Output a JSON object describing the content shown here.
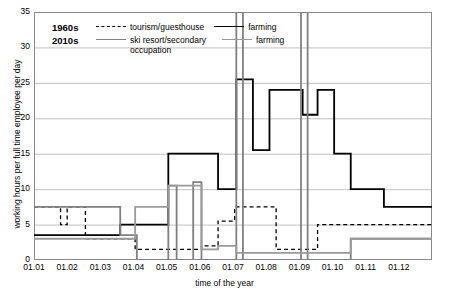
{
  "chart_data": {
    "type": "line",
    "title": "",
    "xlabel": "time of the year",
    "ylabel": "working hours per full time employee per day",
    "ylim": [
      0,
      35
    ],
    "yticks": [
      0,
      5,
      10,
      15,
      20,
      25,
      30,
      35
    ],
    "xticks": [
      "01.01",
      "01.02",
      "01.03",
      "01.04",
      "01.05",
      "01.06",
      "01.07",
      "01.08",
      "01.09",
      "01.10",
      "01.11",
      "01.12"
    ],
    "grid": true,
    "legend": {
      "position": "top-left-inside",
      "groups": [
        {
          "label": "1960s",
          "items": [
            {
              "name": "tourism/guesthouse",
              "style": "dashed",
              "color": "#000000"
            },
            {
              "name": "farming",
              "style": "solid",
              "color": "#000000"
            }
          ]
        },
        {
          "label": "2010s",
          "items": [
            {
              "name": "ski resort/secondary occupation",
              "style": "solid",
              "color": "#808080"
            },
            {
              "name": "farming",
              "style": "solid",
              "color": "#9a9a9a"
            }
          ]
        }
      ]
    },
    "series": [
      {
        "name": "1960s tourism/guesthouse",
        "color": "#000000",
        "dash": "4,3",
        "width": 1.3,
        "steps": [
          {
            "x": 0.0,
            "y": 7.5
          },
          {
            "x": 0.8,
            "y": 7.5
          },
          {
            "x": 0.8,
            "y": 5.0
          },
          {
            "x": 1.0,
            "y": 5.0
          },
          {
            "x": 1.0,
            "y": 7.5
          },
          {
            "x": 1.55,
            "y": 7.5
          },
          {
            "x": 1.55,
            "y": 3.0
          },
          {
            "x": 3.05,
            "y": 3.0
          },
          {
            "x": 3.05,
            "y": 1.5
          },
          {
            "x": 5.05,
            "y": 1.5
          },
          {
            "x": 5.05,
            "y": 2.0
          },
          {
            "x": 5.55,
            "y": 2.0
          },
          {
            "x": 5.55,
            "y": 5.5
          },
          {
            "x": 6.05,
            "y": 5.5
          },
          {
            "x": 6.05,
            "y": 7.5
          },
          {
            "x": 6.55,
            "y": 7.5
          },
          {
            "x": 6.55,
            "y": 7.5
          },
          {
            "x": 7.3,
            "y": 7.5
          },
          {
            "x": 7.3,
            "y": 1.5
          },
          {
            "x": 8.55,
            "y": 1.5
          },
          {
            "x": 8.55,
            "y": 5.0
          },
          {
            "x": 11.0,
            "y": 5.0
          },
          {
            "x": 11.0,
            "y": 5.0
          },
          {
            "x": 12.0,
            "y": 5.0
          }
        ]
      },
      {
        "name": "1960s farming",
        "color": "#000000",
        "dash": "",
        "width": 1.8,
        "steps": [
          {
            "x": 0.0,
            "y": 3.5
          },
          {
            "x": 2.6,
            "y": 3.5
          },
          {
            "x": 2.6,
            "y": 5.0
          },
          {
            "x": 4.05,
            "y": 5.0
          },
          {
            "x": 4.05,
            "y": 15.0
          },
          {
            "x": 5.55,
            "y": 15.0
          },
          {
            "x": 5.55,
            "y": 10.0
          },
          {
            "x": 6.1,
            "y": 10.0
          },
          {
            "x": 6.1,
            "y": 25.5
          },
          {
            "x": 6.6,
            "y": 25.5
          },
          {
            "x": 6.6,
            "y": 15.5
          },
          {
            "x": 7.1,
            "y": 15.5
          },
          {
            "x": 7.1,
            "y": 24.0
          },
          {
            "x": 8.1,
            "y": 24.0
          },
          {
            "x": 8.1,
            "y": 20.5
          },
          {
            "x": 8.55,
            "y": 20.5
          },
          {
            "x": 8.55,
            "y": 24.0
          },
          {
            "x": 9.05,
            "y": 24.0
          },
          {
            "x": 9.05,
            "y": 15.0
          },
          {
            "x": 9.55,
            "y": 15.0
          },
          {
            "x": 9.55,
            "y": 10.0
          },
          {
            "x": 10.55,
            "y": 10.0
          },
          {
            "x": 10.55,
            "y": 7.5
          },
          {
            "x": 12.0,
            "y": 7.5
          }
        ]
      },
      {
        "name": "2010s ski resort/secondary occupation",
        "color": "#808080",
        "dash": "",
        "width": 1.8,
        "steps": [
          {
            "x": 0.0,
            "y": 7.5
          },
          {
            "x": 2.6,
            "y": 7.5
          },
          {
            "x": 2.6,
            "y": 3.5
          },
          {
            "x": 3.1,
            "y": 3.5
          },
          {
            "x": 3.1,
            "y": 0.0
          },
          {
            "x": 4.05,
            "y": 0.0
          },
          {
            "x": 4.05,
            "y": 10.5
          },
          {
            "x": 4.3,
            "y": 10.5
          },
          {
            "x": 4.3,
            "y": 0.0
          },
          {
            "x": 4.8,
            "y": 0.0
          },
          {
            "x": 4.8,
            "y": 11.0
          },
          {
            "x": 5.05,
            "y": 11.0
          },
          {
            "x": 5.05,
            "y": 0.0
          },
          {
            "x": 6.1,
            "y": 0.0
          },
          {
            "x": 6.1,
            "y": 35.0
          },
          {
            "x": 6.3,
            "y": 35.0
          },
          {
            "x": 6.3,
            "y": 0.0
          },
          {
            "x": 8.05,
            "y": 0.0
          },
          {
            "x": 8.05,
            "y": 35.0
          },
          {
            "x": 8.25,
            "y": 35.0
          },
          {
            "x": 8.25,
            "y": 0.0
          },
          {
            "x": 9.55,
            "y": 0.0
          },
          {
            "x": 9.55,
            "y": 3.0
          },
          {
            "x": 12.0,
            "y": 3.0
          }
        ]
      },
      {
        "name": "2010s farming",
        "color": "#9a9a9a",
        "dash": "",
        "width": 1.8,
        "steps": [
          {
            "x": 0.0,
            "y": 3.0
          },
          {
            "x": 3.05,
            "y": 3.0
          },
          {
            "x": 3.05,
            "y": 7.5
          },
          {
            "x": 4.05,
            "y": 7.5
          },
          {
            "x": 4.05,
            "y": 10.5
          },
          {
            "x": 4.55,
            "y": 10.5
          },
          {
            "x": 4.55,
            "y": 10.5
          },
          {
            "x": 5.05,
            "y": 10.5
          },
          {
            "x": 5.05,
            "y": 1.5
          },
          {
            "x": 5.55,
            "y": 1.5
          },
          {
            "x": 5.55,
            "y": 2.0
          },
          {
            "x": 6.1,
            "y": 2.0
          },
          {
            "x": 6.1,
            "y": 1.0
          },
          {
            "x": 9.55,
            "y": 1.0
          },
          {
            "x": 9.55,
            "y": 3.0
          },
          {
            "x": 12.0,
            "y": 3.0
          }
        ]
      }
    ]
  }
}
